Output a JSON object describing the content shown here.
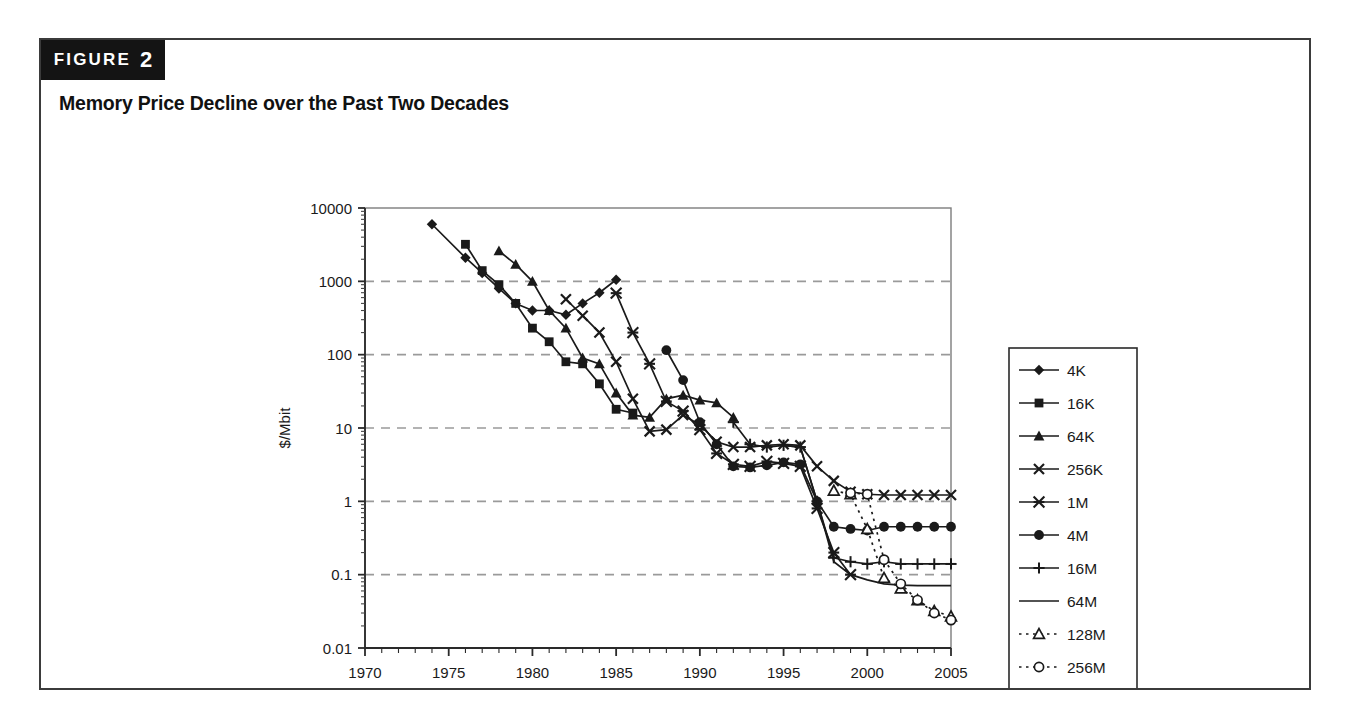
{
  "figure": {
    "banner_word": "FIGURE",
    "banner_number": "2",
    "title": "Memory Price Decline over the Past Two Decades"
  },
  "chart_data": {
    "type": "line",
    "title": "Memory Price Decline over the Past Two Decades",
    "xlabel": "",
    "ylabel": "$/Mbit",
    "xlim": [
      1970,
      2005
    ],
    "ylim": [
      0.01,
      10000
    ],
    "yscale": "log",
    "grid": "horizontal-dashed",
    "legend_position": "right",
    "x_ticks": [
      "1970",
      "1975",
      "1980",
      "1985",
      "1990",
      "1995",
      "2000",
      "2005"
    ],
    "x_tick_values": [
      1970,
      1975,
      1980,
      1985,
      1990,
      1995,
      2000,
      2005
    ],
    "x_minor_step": 1,
    "y_ticks": [
      "0.01",
      "0.1",
      "1",
      "10",
      "100",
      "1000",
      "10000"
    ],
    "y_tick_values": [
      0.01,
      0.1,
      1,
      10,
      100,
      1000,
      10000
    ],
    "series": [
      {
        "name": "4K",
        "marker": "diamond",
        "line": "solid",
        "x": [
          1974,
          1976,
          1977,
          1978,
          1979,
          1980,
          1981,
          1982,
          1983,
          1984,
          1985
        ],
        "y": [
          6000,
          2100,
          1300,
          800,
          500,
          400,
          400,
          350,
          500,
          700,
          1050
        ]
      },
      {
        "name": "16K",
        "marker": "square",
        "line": "solid",
        "x": [
          1976,
          1977,
          1978,
          1979,
          1980,
          1981,
          1982,
          1983,
          1984,
          1985,
          1986
        ],
        "y": [
          3200,
          1400,
          900,
          500,
          230,
          150,
          80,
          75,
          40,
          18,
          16
        ]
      },
      {
        "name": "64K",
        "marker": "triangle",
        "line": "solid",
        "x": [
          1978,
          1979,
          1980,
          1981,
          1982,
          1983,
          1984,
          1985,
          1986,
          1987,
          1988,
          1989,
          1990,
          1991,
          1992
        ],
        "y": [
          2600,
          1700,
          1000,
          400,
          230,
          90,
          75,
          30,
          15,
          14,
          25,
          28,
          24,
          22,
          14
        ]
      },
      {
        "name": "256K",
        "marker": "cross",
        "line": "solid",
        "x": [
          1982,
          1983,
          1984,
          1985,
          1986,
          1987,
          1988,
          1989,
          1990,
          1991,
          1992,
          1993,
          1994,
          1995,
          1996,
          1997,
          1998,
          1999,
          2000,
          2001,
          2002,
          2003,
          2004,
          2005
        ],
        "y": [
          570,
          340,
          200,
          80,
          25,
          9,
          9.5,
          15,
          11,
          6.5,
          5.5,
          5.5,
          5.8,
          6.0,
          5.8,
          3.0,
          1.9,
          1.35,
          1.25,
          1.22,
          1.22,
          1.22,
          1.22,
          1.22
        ]
      },
      {
        "name": "1M",
        "marker": "star",
        "line": "solid",
        "x": [
          1985,
          1986,
          1987,
          1988,
          1989,
          1990,
          1991,
          1992,
          1993,
          1994,
          1995,
          1996,
          1997,
          1998,
          1999
        ],
        "y": [
          690,
          200,
          75,
          23,
          17,
          9.5,
          4.5,
          3.2,
          3.0,
          3.5,
          3.3,
          3.0,
          0.8,
          0.2,
          0.1
        ]
      },
      {
        "name": "4M",
        "marker": "circle",
        "line": "solid",
        "x": [
          1988,
          1989,
          1990,
          1991,
          1992,
          1993,
          1994,
          1995,
          1996,
          1997,
          1998,
          1999,
          2000,
          2001,
          2002,
          2003,
          2004,
          2005
        ],
        "y": [
          115,
          45,
          12,
          6.0,
          3.0,
          2.9,
          3.1,
          3.4,
          3.2,
          1.0,
          0.45,
          0.42,
          0.4,
          0.45,
          0.45,
          0.45,
          0.45,
          0.45
        ]
      },
      {
        "name": "16M",
        "marker": "plus",
        "line": "solid",
        "x": [
          1992,
          1993,
          1994,
          1995,
          1996,
          1997,
          1998,
          1999,
          2000,
          2001,
          2002,
          2003,
          2004,
          2005
        ],
        "y": [
          12,
          6.0,
          5.5,
          5.8,
          5.5,
          1.0,
          0.17,
          0.15,
          0.14,
          0.15,
          0.14,
          0.14,
          0.14,
          0.14
        ]
      },
      {
        "name": "64M",
        "marker": "none",
        "line": "solid",
        "x": [
          1995,
          1996,
          1997,
          1998,
          1999,
          2000,
          2001,
          2002,
          2003,
          2004,
          2005
        ],
        "y": [
          5.8,
          5.5,
          1.0,
          0.15,
          0.1,
          0.085,
          0.075,
          0.072,
          0.071,
          0.071,
          0.071
        ]
      },
      {
        "name": "128M",
        "marker": "triangle-open",
        "line": "dotted",
        "x": [
          1998,
          1999,
          2000,
          2001,
          2002,
          2003,
          2004,
          2005
        ],
        "y": [
          1.4,
          1.25,
          0.42,
          0.09,
          0.065,
          0.045,
          0.032,
          0.027
        ]
      },
      {
        "name": "256M",
        "marker": "circle-open",
        "line": "dotted",
        "x": [
          1999,
          2000,
          2001,
          2002,
          2003,
          2004,
          2005
        ],
        "y": [
          1.3,
          1.25,
          0.16,
          0.075,
          0.045,
          0.03,
          0.024
        ]
      }
    ]
  },
  "legend": {
    "entries": [
      {
        "label": "4K"
      },
      {
        "label": "16K"
      },
      {
        "label": "64K"
      },
      {
        "label": "256K"
      },
      {
        "label": "1M"
      },
      {
        "label": "4M"
      },
      {
        "label": "16M"
      },
      {
        "label": "64M"
      },
      {
        "label": "128M"
      },
      {
        "label": "256M"
      }
    ]
  },
  "colors": {
    "ink": "#1a1a1a",
    "grid": "#9a9a9a",
    "panel_border": "#3b3b3b",
    "banner_bg": "#141414"
  }
}
